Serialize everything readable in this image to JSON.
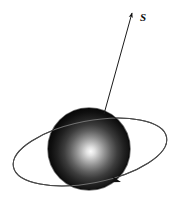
{
  "figure": {
    "name": "rotating-sphere-with-orbit-diagram",
    "background_color": "#ffffff",
    "width": 178,
    "height": 205
  },
  "sphere": {
    "name": "shaded-sphere",
    "center_x": 89,
    "center_y": 149,
    "radius": 41,
    "highlight_x": 92,
    "highlight_y": 152,
    "highlight_color": "#f2f2f2",
    "mid_color": "#3c3c3c",
    "edge_color": "#050505"
  },
  "spin_axis": {
    "name": "spin-axis-arrow",
    "label": "S",
    "label_x": 140,
    "label_y": 21,
    "start_x": 104,
    "start_y": 114,
    "end_x": 132,
    "end_y": 13,
    "color": "#1a1a1a",
    "line_width": 1
  },
  "orbit": {
    "name": "orbit-ellipse",
    "center_x": 90,
    "center_y": 152,
    "semi_major": 78,
    "semi_minor": 31,
    "rotation_deg": -11,
    "color": "#4a4a4a",
    "line_width": 1,
    "direction_arrow_x": 121,
    "direction_arrow_y": 182,
    "direction_arrow_angle_deg": 196
  },
  "annotations": {
    "axis_label_text": "S"
  }
}
